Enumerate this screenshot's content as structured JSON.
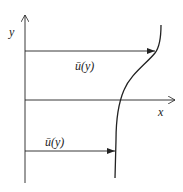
{
  "diagram": {
    "axes": {
      "y_label": "y",
      "x_label": "x"
    },
    "arrows": [
      {
        "label": "ū(y)",
        "position": "upper"
      },
      {
        "label": "ū(y)",
        "position": "lower"
      }
    ],
    "curve": {
      "description": "velocity profile ū(y)"
    },
    "colors": {
      "line": "#222222",
      "background": "#ffffff"
    }
  }
}
